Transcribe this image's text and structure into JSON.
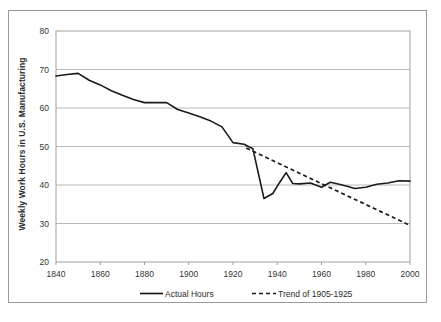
{
  "chart_data": {
    "type": "line",
    "title": "",
    "xlabel": "",
    "ylabel": "Weekly Work Hours in U.S. Manufacturing",
    "xlim": [
      1840,
      2000
    ],
    "ylim": [
      20,
      80
    ],
    "grid": true,
    "legend_position": "bottom",
    "xticks": [
      1840,
      1860,
      1880,
      1900,
      1920,
      1940,
      1960,
      1980,
      2000
    ],
    "yticks": [
      20,
      30,
      40,
      50,
      60,
      70,
      80
    ],
    "series": [
      {
        "name": "Actual Hours",
        "style": "solid",
        "color": "#1a1a1a",
        "x": [
          1840,
          1845,
          1850,
          1855,
          1860,
          1865,
          1870,
          1875,
          1880,
          1885,
          1890,
          1895,
          1900,
          1905,
          1910,
          1915,
          1920,
          1925,
          1929,
          1934,
          1938,
          1941,
          1944,
          1947,
          1950,
          1955,
          1960,
          1964,
          1968,
          1972,
          1975,
          1980,
          1985,
          1990,
          1995,
          2000
        ],
        "y": [
          68.3,
          68.7,
          69.0,
          67.2,
          66.0,
          64.5,
          63.3,
          62.2,
          61.4,
          61.4,
          61.4,
          59.6,
          58.7,
          57.7,
          56.6,
          55.1,
          51.0,
          50.6,
          49.4,
          36.5,
          37.8,
          40.6,
          43.2,
          40.4,
          40.3,
          40.5,
          39.4,
          40.7,
          40.2,
          39.6,
          39.1,
          39.4,
          40.2,
          40.5,
          41.1,
          41.0
        ]
      },
      {
        "name": "Trend of 1905-1925",
        "style": "dashed",
        "color": "#1a1a1a",
        "x": [
          1926,
          2000
        ],
        "y": [
          49.6,
          29.5
        ]
      }
    ],
    "legend": [
      {
        "label": "Actual Hours",
        "style": "solid"
      },
      {
        "label": "Trend of 1905-1925",
        "style": "dashed"
      }
    ]
  }
}
